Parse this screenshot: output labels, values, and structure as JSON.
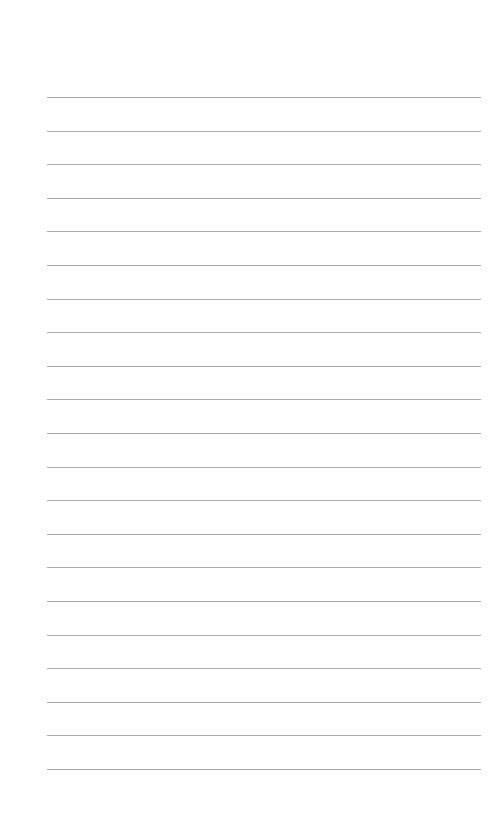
{
  "page": {
    "type": "lined-paper",
    "line_count": 21,
    "first_line_y": 97,
    "line_spacing": 33.6,
    "line_left": 47,
    "line_width": 434,
    "line_color": "#a9a9a9",
    "background_color": "#ffffff"
  }
}
